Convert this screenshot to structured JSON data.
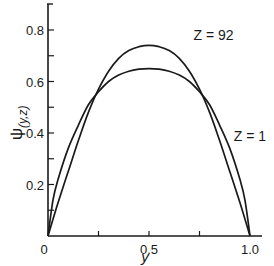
{
  "chart_data": {
    "type": "line",
    "title": "",
    "xlabel": "y",
    "ylabel": "ψ(y,z)",
    "ylabel_main": "ψ",
    "ylabel_sub": "(y,z)",
    "xlim": [
      0,
      1.0
    ],
    "ylim": [
      0,
      0.9
    ],
    "grid": false,
    "x_ticks": [
      0,
      0.25,
      0.5,
      0.75,
      1.0
    ],
    "x_tick_labels": [
      "0",
      "",
      "0.5",
      "",
      "1.0"
    ],
    "y_ticks": [
      0,
      0.1,
      0.2,
      0.3,
      0.4,
      0.5,
      0.6,
      0.7,
      0.8
    ],
    "y_tick_labels": [
      "0",
      "",
      "0.2",
      "",
      "0.4",
      "",
      "0.6",
      "",
      "0.8"
    ],
    "series": [
      {
        "name": "Z = 92",
        "label": "Z = 92",
        "x": [
          0,
          0.05,
          0.1,
          0.15,
          0.2,
          0.25,
          0.3,
          0.35,
          0.4,
          0.45,
          0.5,
          0.55,
          0.6,
          0.65,
          0.7,
          0.75,
          0.8,
          0.85,
          0.9,
          0.95,
          1.0
        ],
        "values": [
          0,
          0.13,
          0.25,
          0.37,
          0.48,
          0.57,
          0.64,
          0.69,
          0.72,
          0.735,
          0.74,
          0.735,
          0.72,
          0.69,
          0.64,
          0.57,
          0.48,
          0.37,
          0.25,
          0.13,
          0
        ]
      },
      {
        "name": "Z = 1",
        "label": "Z = 1",
        "x": [
          0,
          0.025,
          0.05,
          0.1,
          0.15,
          0.2,
          0.25,
          0.3,
          0.35,
          0.4,
          0.45,
          0.5,
          0.55,
          0.6,
          0.65,
          0.7,
          0.75,
          0.8,
          0.85,
          0.9,
          0.95,
          0.975,
          1.0
        ],
        "values": [
          0,
          0.14,
          0.22,
          0.34,
          0.43,
          0.51,
          0.56,
          0.6,
          0.625,
          0.64,
          0.648,
          0.65,
          0.648,
          0.64,
          0.625,
          0.6,
          0.56,
          0.51,
          0.43,
          0.34,
          0.22,
          0.14,
          0
        ]
      }
    ],
    "annotations": [
      {
        "text": "Z = 92",
        "x": 0.72,
        "y": 0.76
      },
      {
        "text": "Z = 1",
        "x": 0.92,
        "y": 0.37
      }
    ]
  },
  "layout": {
    "origin_px": [
      48,
      236
    ],
    "x_scale_px_per_unit": 202,
    "y_scale_px_per_unit": 257.5,
    "y_axis_top_px": 4,
    "x_axis_right_px": 262,
    "line_color": "#1a1a1a"
  }
}
